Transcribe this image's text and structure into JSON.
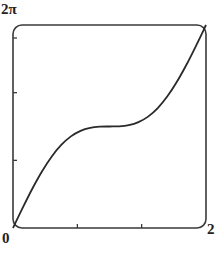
{
  "chart_data": {
    "type": "line",
    "title": "",
    "xlabel": "",
    "ylabel": "",
    "xlim": [
      0,
      2
    ],
    "ylim": [
      0,
      6.2832
    ],
    "x_tick_labels": [
      "0",
      "2"
    ],
    "y_tick_labels": [
      "2π"
    ],
    "x_ticks": [
      0,
      0.667,
      1.333,
      2
    ],
    "y_ticks": [
      0,
      2.094,
      4.189,
      6.283
    ],
    "grid": false,
    "legend": null,
    "series": [
      {
        "name": "y = πx + sin(πx)",
        "x": [
          0,
          0.1,
          0.2,
          0.3,
          0.4,
          0.5,
          0.6,
          0.7,
          0.8,
          0.9,
          1.0,
          1.1,
          1.2,
          1.3,
          1.4,
          1.5,
          1.6,
          1.7,
          1.8,
          1.9,
          2.0
        ],
        "values": [
          0,
          0.623,
          1.216,
          1.751,
          2.208,
          2.571,
          2.836,
          3.008,
          3.101,
          3.136,
          3.142,
          3.147,
          3.182,
          3.275,
          3.447,
          3.712,
          4.075,
          4.532,
          5.067,
          5.66,
          6.283
        ]
      }
    ]
  },
  "labels": {
    "ymax": "2π",
    "x0": "0",
    "xmax": "2"
  },
  "colors": {
    "line": "#2a2a2a",
    "frame": "#3a3a3a"
  }
}
